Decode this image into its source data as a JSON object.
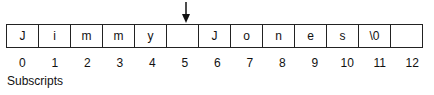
{
  "diagram": {
    "cells": [
      "J",
      "i",
      "m",
      "m",
      "y",
      "",
      "J",
      "o",
      "n",
      "e",
      "s",
      "\\0",
      ""
    ],
    "subscripts": [
      "0",
      "1",
      "2",
      "3",
      "4",
      "5",
      "6",
      "7",
      "8",
      "9",
      "10",
      "11",
      "12"
    ],
    "subscripts_label": "Subscripts",
    "pointer_index": 5,
    "pointer_icon": "down-arrow-icon"
  }
}
